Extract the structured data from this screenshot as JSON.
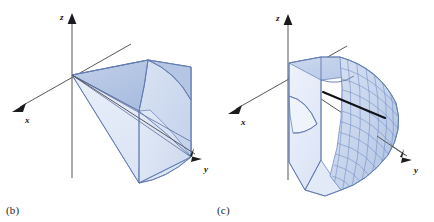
{
  "figure": {
    "background_color": "#ffffff",
    "width": 434,
    "height": 222,
    "panels": [
      {
        "id": "b",
        "caption": "(b)",
        "description": "Wedge-shaped solid cut from a cone, shaded light blue with a curved spherical cap face",
        "origin": {
          "x": 72,
          "y": 75
        },
        "axes": [
          {
            "name": "z",
            "label": "z",
            "label_x": 62,
            "label_y": 17,
            "tip_x": 72,
            "tip_y": 14,
            "tail_x": 72,
            "tail_y": 178
          },
          {
            "name": "x",
            "label": "x",
            "label_x": 27,
            "label_y": 121,
            "tip_x": 14,
            "tip_y": 111,
            "tail_x": 131,
            "tail_y": 44
          },
          {
            "name": "y",
            "label": "y",
            "label_x": 205,
            "label_y": 170,
            "tip_x": 201,
            "tip_y": 158,
            "tail_x": 72,
            "tail_y": 75
          }
        ],
        "colors": {
          "fill_light": "#dfe7f4",
          "fill_mid": "#ccd8ed",
          "fill_dark": "#b9c9e6",
          "edge": "#5d76ad",
          "axis": "#57585c"
        }
      },
      {
        "id": "c",
        "caption": "(c)",
        "description": "Spherical mesh solid with a thick black radial chord drawn across the curved face",
        "origin": {
          "x": 71,
          "y": 77
        },
        "axes": [
          {
            "name": "z",
            "label": "z",
            "label_x": 61,
            "label_y": 19,
            "tip_x": 71,
            "tip_y": 15,
            "tail_x": 71,
            "tail_y": 180
          },
          {
            "name": "x",
            "label": "x",
            "label_x": 26,
            "label_y": 123,
            "tip_x": 13,
            "tip_y": 113,
            "tail_x": 130,
            "tail_y": 46
          },
          {
            "name": "y",
            "label": "y",
            "label_x": 198,
            "label_y": 170,
            "tip_x": 194,
            "tip_y": 160,
            "tail_x": 71,
            "tail_y": 77
          }
        ],
        "chord": {
          "x1": 106,
          "y1": 92,
          "x2": 168,
          "y2": 118
        },
        "mesh": {
          "u_divisions": 13,
          "v_divisions": 12
        },
        "colors": {
          "fill_light": "#e4ebf6",
          "fill_mid": "#cdd9ee",
          "fill_dark": "#b4c5e4",
          "mesh": "#6e8ac2",
          "edge": "#5d76ad",
          "chord": "#111118",
          "axis": "#57585c"
        }
      }
    ]
  }
}
